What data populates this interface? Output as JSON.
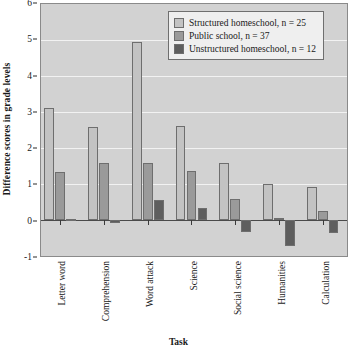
{
  "chart_data": {
    "type": "bar",
    "title": "",
    "xlabel": "Task",
    "ylabel": "Difference scores in grade levels",
    "ylim": [
      -1,
      6
    ],
    "yticks": [
      -1,
      0,
      1,
      2,
      3,
      4,
      5,
      6
    ],
    "grid": true,
    "legend_position": "top-right",
    "categories": [
      "Letter word",
      "Comprehension",
      "Word attack",
      "Science",
      "Social science",
      "Humanities",
      "Calculation"
    ],
    "series": [
      {
        "name": "Structured homeschool, n = 25",
        "color": "#c3c3c3",
        "values": [
          3.12,
          2.58,
          4.95,
          2.62,
          1.58,
          1.0,
          0.92
        ]
      },
      {
        "name": "Public school, n = 37",
        "color": "#9a9a9a",
        "values": [
          1.33,
          1.58,
          1.58,
          1.35,
          0.58,
          0.05,
          0.24
        ]
      },
      {
        "name": "Unstructured homeschool, n = 12",
        "color": "#5e5e5e",
        "values": [
          0.03,
          -0.08,
          0.55,
          0.34,
          -0.34,
          -0.72,
          -0.36
        ]
      }
    ]
  },
  "axis": {
    "y_tick_labels": [
      "6",
      "5",
      "4",
      "3",
      "2",
      "1",
      "0",
      "-1"
    ],
    "y_title": "Difference scores in grade levels",
    "x_title": "Task"
  },
  "legend": {
    "entries": [
      "Structured homeschool, n = 25",
      "Public school, n = 37",
      "Unstructured homeschool, n = 12"
    ]
  },
  "colors": {
    "plot_background": "#d2d2d2",
    "gridline": "#f2f2f2",
    "axis": "#2b2b2b",
    "series_1": "#c3c3c3",
    "series_2": "#9a9a9a",
    "series_3": "#5e5e5e"
  }
}
